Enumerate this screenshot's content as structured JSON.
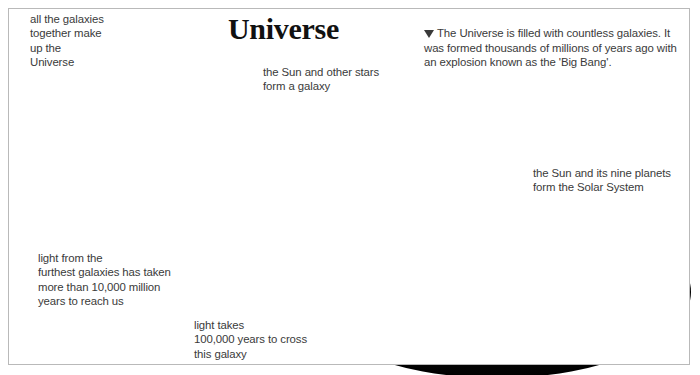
{
  "page": {
    "title_heading": "Universe",
    "background_color": "#ffffff",
    "border_color": "#b9b9b9",
    "text_color": "#3a3a3a"
  },
  "captions": {
    "universe_sphere": "all the galaxies\ntogether make\nup the\nUniverse",
    "light_furthest": "light from the\nfurthest galaxies has taken\nmore than 10,000 million\nyears to reach us",
    "galaxy_stars": "the Sun and other stars\nform a galaxy",
    "light_cross_galaxy": "light takes\n100,000 years to cross\nthis galaxy",
    "solar_system": "the Sun and its nine planets\nform the Solar System",
    "big_bang_marker": "▼",
    "big_bang": "The Universe is filled with countless galaxies. It was formed thousands of millions of years ago with an explosion known as the 'Big Bang'."
  },
  "illustration": {
    "universe_sphere_label": "universe-sphere",
    "galaxy_label": "spiral-galaxy",
    "solar_system_label": "solar-system-disc",
    "sun_label": "sun",
    "orbit_count": 9,
    "planet_labels": [
      "inner-planet",
      "ringed-planet-saturn",
      "outer-planet",
      "distant-planet"
    ],
    "zoom_ray_label": "zoom-ray"
  }
}
